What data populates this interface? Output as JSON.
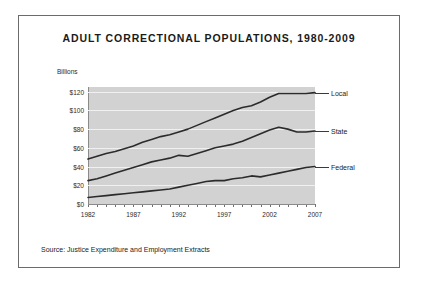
{
  "figure": {
    "title": "ADULT CORRECTIONAL POPULATIONS, 1980-2009",
    "y_unit_label": "Billions",
    "source_note": "Source: Justice Expenditure and Employment Extracts"
  },
  "chart_data": {
    "type": "line",
    "title": "ADULT CORRECTIONAL POPULATIONS, 1980-2009",
    "xlabel": "",
    "ylabel": "Billions",
    "ylim": [
      0,
      125
    ],
    "xlim": [
      1982,
      2007
    ],
    "grid": true,
    "legend_position": "right-inline",
    "y_tick_labels": [
      "$0",
      "$20",
      "$40",
      "$60",
      "$80",
      "$100",
      "$120"
    ],
    "y_tick_values": [
      0,
      20,
      40,
      60,
      80,
      100,
      120
    ],
    "x_tick_labels": [
      "1982",
      "1987",
      "1992",
      "1997",
      "2002",
      "2007"
    ],
    "x_tick_values": [
      1982,
      1987,
      1992,
      1997,
      2002,
      2007
    ],
    "x": [
      1982,
      1983,
      1984,
      1985,
      1986,
      1987,
      1988,
      1989,
      1990,
      1991,
      1992,
      1993,
      1994,
      1995,
      1996,
      1997,
      1998,
      1999,
      2000,
      2001,
      2002,
      2003,
      2004,
      2005,
      2006,
      2007
    ],
    "series": [
      {
        "name": "Local",
        "color": "#2b2b2b",
        "label_value": 119,
        "values": [
          48,
          51,
          54,
          56,
          59,
          62,
          66,
          69,
          72,
          74,
          77,
          80,
          84,
          88,
          92,
          96,
          100,
          103,
          105,
          109,
          114,
          118,
          118,
          118,
          118,
          119
        ]
      },
      {
        "name": "State",
        "color": "#2b2b2b",
        "label_value": 78,
        "values": [
          25,
          27,
          30,
          33,
          36,
          39,
          42,
          45,
          47,
          49,
          52,
          51,
          54,
          57,
          60,
          62,
          64,
          67,
          71,
          75,
          79,
          82,
          80,
          77,
          77,
          78
        ]
      },
      {
        "name": "Federal",
        "color": "#2b2b2b",
        "label_value": 40,
        "values": [
          7,
          8,
          9,
          10,
          11,
          12,
          13,
          14,
          15,
          16,
          18,
          20,
          22,
          24,
          25,
          25,
          27,
          28,
          30,
          29,
          31,
          33,
          35,
          37,
          39,
          40
        ]
      }
    ]
  }
}
